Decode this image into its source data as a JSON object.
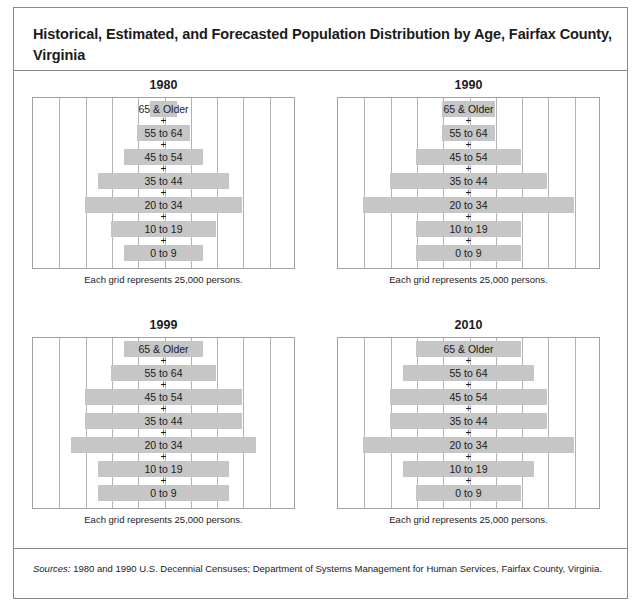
{
  "figure": {
    "title": "Historical, Estimated, and Forecasted Population Distribution by Age, Fairfax County, Virginia",
    "sources_lead": "Sources:",
    "sources_text": " 1980 and 1990 U.S. Decennial Censuses; Department of Systems Management for Human Services, Fairfax County, Virginia.",
    "panel_caption": "Each grid represents 25,000 persons.",
    "separator": "+",
    "bar_color": "#c6c6c6",
    "grid_color": "#b4b4b4",
    "border_color": "#8a8a8a"
  },
  "chart_data": {
    "type": "bar",
    "title": "Historical, Estimated, and Forecasted Population Distribution by Age, Fairfax County, Virginia",
    "subtitle": "",
    "xlabel": "",
    "ylabel": "Age group",
    "grid": true,
    "grid_unit_persons": 25000,
    "grid_columns": 10,
    "xlim": [
      0,
      250000
    ],
    "legend": "none",
    "orientation": "horizontal-centered",
    "categories": [
      "65 & Older",
      "55 to 64",
      "45 to 54",
      "35 to 44",
      "20 to 34",
      "10 to 19",
      "0 to 9"
    ],
    "panels": [
      {
        "year": "1980",
        "caption": "Each grid represents 25,000 persons.",
        "values": [
          25000,
          50000,
          75000,
          125000,
          150000,
          100000,
          75000
        ]
      },
      {
        "year": "1990",
        "caption": "Each grid represents 25,000 persons.",
        "values": [
          50000,
          50000,
          100000,
          150000,
          200000,
          100000,
          100000
        ]
      },
      {
        "year": "1999",
        "caption": "Each grid represents 25,000 persons.",
        "values": [
          75000,
          100000,
          150000,
          150000,
          175000,
          125000,
          125000
        ]
      },
      {
        "year": "2010",
        "caption": "Each grid represents 25,000 persons.",
        "values": [
          100000,
          125000,
          150000,
          150000,
          200000,
          125000,
          100000
        ]
      }
    ]
  }
}
